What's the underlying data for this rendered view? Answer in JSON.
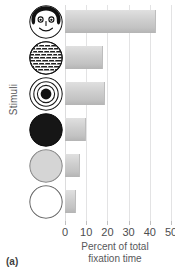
{
  "panel": {
    "label": "(a)"
  },
  "chart_data": {
    "type": "bar",
    "orientation": "horizontal",
    "title": "",
    "xlabel": "Percent of total fixation time",
    "xlabel_lines": [
      "Percent of total",
      "fixation time"
    ],
    "ylabel": "Stimuli",
    "xlim": [
      0,
      50
    ],
    "xticks": [
      0,
      10,
      20,
      30,
      40,
      50
    ],
    "xticklabels": [
      "0",
      "10",
      "20",
      "30",
      "40",
      "50"
    ],
    "grid": "vertical",
    "legend": "none",
    "categories": [
      "face",
      "newsprint",
      "bullseye",
      "red circle",
      "yellow circle",
      "white circle"
    ],
    "values": [
      43,
      18,
      19,
      10,
      7,
      5
    ],
    "bar_color": "#cfcfcf",
    "gridline_color": "#e3e3e4"
  },
  "stimuli": [
    {
      "name": "face",
      "icon": "face-circle-icon"
    },
    {
      "name": "newsprint",
      "icon": "newsprint-circle-icon"
    },
    {
      "name": "bullseye",
      "icon": "bullseye-circle-icon"
    },
    {
      "name": "red circle",
      "icon": "solid-dark-circle-icon"
    },
    {
      "name": "yellow circle",
      "icon": "light-gray-circle-icon"
    },
    {
      "name": "white circle",
      "icon": "white-circle-icon"
    }
  ]
}
